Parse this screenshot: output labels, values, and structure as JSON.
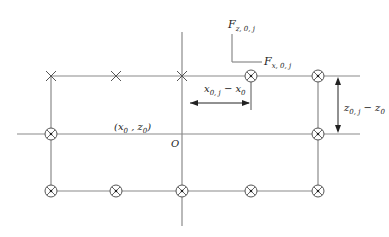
{
  "diagram": {
    "labels": {
      "force_z": "F",
      "force_z_sub": "z, 0, j",
      "force_x": "F",
      "force_x_sub": "x, 0, j",
      "dim_x": "x",
      "dim_x_sub1": "0, j",
      "dim_x_mid": " − x",
      "dim_x_sub2": "0",
      "dim_z": "z",
      "dim_z_sub1": "0, j",
      "dim_z_mid": " − z",
      "dim_z_sub2": "0",
      "point_label": "(x",
      "point_label_sub1": "0",
      "point_label_mid": " , z",
      "point_label_sub2": "0",
      "point_label_end": ")",
      "origin": "O"
    },
    "colors": {
      "line": "#8a8a8a",
      "marker": "#555555",
      "text": "#222222"
    },
    "markers": {
      "top_row": [
        "cross",
        "cross",
        "cross",
        "circle-cross",
        "circle-cross"
      ],
      "middle_row": [
        "circle-cross",
        "circle-cross"
      ],
      "bottom_row": [
        "circle-cross",
        "circle-cross",
        "circle-cross",
        "circle-cross",
        "circle-cross"
      ]
    }
  }
}
